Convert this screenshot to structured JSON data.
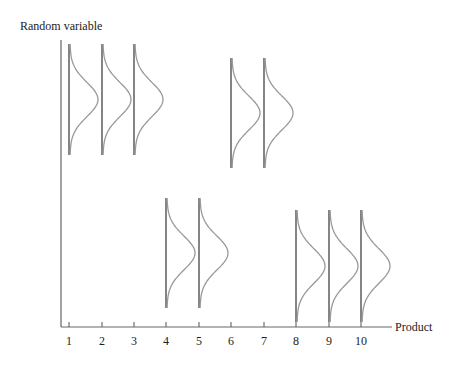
{
  "chart_data": {
    "type": "diagram",
    "title": "",
    "ylabel": "Random variable",
    "xlabel": "Product",
    "categories": [
      "1",
      "2",
      "3",
      "4",
      "5",
      "6",
      "7",
      "8",
      "9",
      "10"
    ],
    "tick_x": [
      69,
      102,
      134,
      166,
      199,
      231,
      264,
      296,
      329,
      361
    ],
    "distributions": [
      {
        "product": "1",
        "top": 44,
        "bottom": 155
      },
      {
        "product": "2",
        "top": 44,
        "bottom": 155
      },
      {
        "product": "3",
        "top": 44,
        "bottom": 155
      },
      {
        "product": "4",
        "top": 198,
        "bottom": 308
      },
      {
        "product": "5",
        "top": 198,
        "bottom": 308
      },
      {
        "product": "6",
        "top": 58,
        "bottom": 168
      },
      {
        "product": "7",
        "top": 58,
        "bottom": 168
      },
      {
        "product": "8",
        "top": 210,
        "bottom": 322
      },
      {
        "product": "9",
        "top": 210,
        "bottom": 322
      },
      {
        "product": "10",
        "top": 210,
        "bottom": 322
      }
    ],
    "curve_width": 28,
    "colors": {
      "axis": "#444444",
      "curve": "#999999",
      "baseline": "#333333"
    }
  }
}
